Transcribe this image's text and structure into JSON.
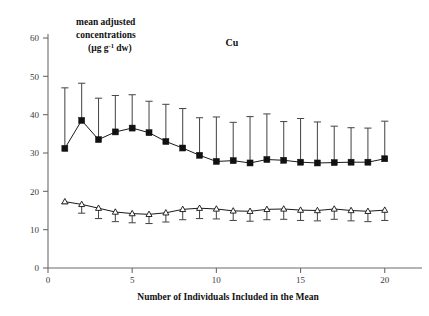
{
  "chart_data": {
    "type": "line",
    "title": "Cu",
    "xlabel": "Number of Individuals Included in the Mean",
    "ylabel": "mean adjusted concentrations (µg g⁻¹ dw)",
    "ylabel_lines": [
      "mean adjusted",
      "concentrations",
      "(µg g",
      "-1",
      " dw)"
    ],
    "xlim": [
      0,
      21.5
    ],
    "ylim": [
      0,
      60
    ],
    "xticks": [
      0,
      5,
      10,
      15,
      20
    ],
    "yticks": [
      0,
      10,
      20,
      30,
      40,
      50,
      60
    ],
    "xticklabels": [
      "0",
      "5",
      "10",
      "15",
      "20"
    ],
    "yticklabels": [
      "0",
      "10",
      "20",
      "30",
      "40",
      "50",
      "60"
    ],
    "grid": false,
    "legend": "none",
    "x": [
      1,
      2,
      3,
      4,
      5,
      6,
      7,
      8,
      9,
      10,
      11,
      12,
      13,
      14,
      15,
      16,
      17,
      18,
      19,
      20
    ],
    "series": [
      {
        "name": "upper-series-filled-squares",
        "marker": "filled-square",
        "color": "#111111",
        "errorbar_direction": "up",
        "values": [
          31.2,
          38.5,
          33.5,
          35.5,
          36.5,
          35.3,
          33.0,
          31.3,
          29.4,
          27.8,
          28.0,
          27.4,
          28.3,
          28.1,
          27.6,
          27.4,
          27.5,
          27.6,
          27.6,
          28.5
        ],
        "error_upper": [
          47.0,
          48.2,
          44.3,
          45.0,
          45.2,
          43.5,
          42.7,
          41.6,
          39.2,
          39.4,
          38.0,
          39.5,
          40.2,
          38.2,
          39.0,
          38.1,
          37.0,
          36.6,
          36.5,
          38.3
        ]
      },
      {
        "name": "lower-series-open-triangles",
        "marker": "open-triangle",
        "color": "#111111",
        "errorbar_direction": "down",
        "values": [
          17.3,
          16.6,
          15.6,
          14.6,
          14.2,
          14.0,
          14.4,
          15.3,
          15.6,
          15.4,
          14.9,
          14.8,
          15.3,
          15.4,
          15.1,
          15.0,
          15.4,
          15.0,
          14.8,
          15.1
        ],
        "error_lower": [
          16.8,
          14.3,
          12.9,
          12.1,
          11.8,
          11.6,
          12.0,
          12.6,
          12.9,
          12.8,
          12.4,
          12.2,
          12.6,
          12.7,
          12.4,
          12.3,
          12.7,
          12.3,
          12.1,
          12.4
        ]
      }
    ]
  }
}
